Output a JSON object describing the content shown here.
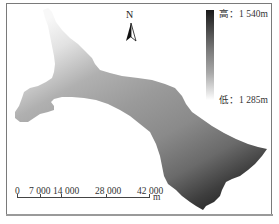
{
  "map": {
    "type": "elevation (DEM) map",
    "colors": {
      "high": "#1a1a1a",
      "low": "#ffffff",
      "mid": "#8a8a8a",
      "frame": "#7a7a7a"
    }
  },
  "north_arrow": {
    "label": "N",
    "icon": "north-arrow-icon"
  },
  "legend": {
    "high_label": "高：1 540m",
    "low_label": "低：1 285m",
    "high_value": 1540,
    "low_value": 1285,
    "unit": "m"
  },
  "scale_bar": {
    "ticks": [
      "0",
      "7 000",
      "14 000",
      "28 000",
      "42 000"
    ],
    "tick_values": [
      0,
      7000,
      14000,
      28000,
      42000
    ],
    "unit": "m"
  }
}
